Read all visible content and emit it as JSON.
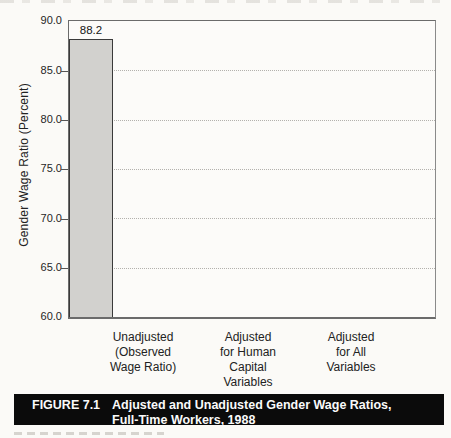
{
  "chart_data": {
    "type": "bar",
    "categories": [
      "Unadjusted (Observed Wage Ratio)",
      "Adjusted for Human Capital Variables",
      "Adjusted for All Variables"
    ],
    "category_labels_multiline": [
      "Unadjusted\n(Observed\nWage Ratio)",
      "Adjusted\nfor Human\nCapital\nVariables",
      "Adjusted\nfor All\nVariables"
    ],
    "values": [
      72.4,
      80.5,
      88.2
    ],
    "value_labels": [
      "72.4",
      "80.5",
      "88.2"
    ],
    "xlabel": "",
    "ylabel": "Gender Wage Ratio (Percent)",
    "ylim": [
      60,
      90
    ],
    "ytick_labels": [
      "90.0",
      "85.0",
      "80.0",
      "75.0",
      "70.0",
      "65.0",
      "60.0"
    ],
    "gridline_values": [
      85,
      80,
      75,
      70,
      65
    ],
    "grid_style": "horizontal dotted",
    "legend": "none",
    "bar_fill_color": "#d2d1ce",
    "bar_border_color": "#3a3a3a"
  },
  "caption": {
    "figure_label": "FIGURE 7.1",
    "title": "Adjusted and Unadjusted Gender Wage Ratios,\nFull-Time Workers, 1988",
    "bar_background": "#0b0b0b",
    "text_color": "#fafafa"
  }
}
